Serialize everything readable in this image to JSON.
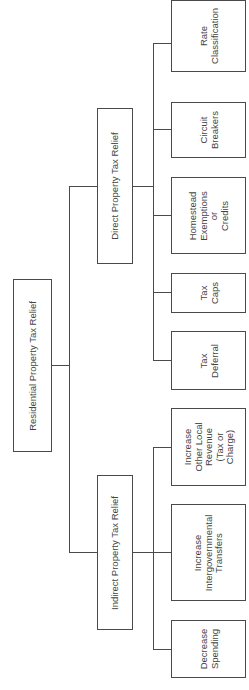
{
  "diagram": {
    "orientation": "rotated-90-ccw",
    "root": {
      "label": "Residential Property Tax Relief"
    },
    "branches": [
      {
        "label": "Direct Property Tax Relief",
        "children": [
          {
            "label": "Rate\nClassification"
          },
          {
            "label": "Circuit\nBreakers"
          },
          {
            "label": "Homestead\nExemptions\nor\nCredits"
          },
          {
            "label": "Tax\nCaps"
          },
          {
            "label": "Tax\nDeferral"
          }
        ]
      },
      {
        "label": "Indirect Property Tax Relief",
        "children": [
          {
            "label": "Increase\nOther Local\nRevenue\n(Tax or\nCharge)"
          },
          {
            "label": "Increase\nIntergovernmental\nTransfers"
          },
          {
            "label": "Decrease\nSpending"
          }
        ]
      }
    ],
    "colors": {
      "line": "#4a4a4a",
      "text": "#444444",
      "background": "#ffffff"
    }
  }
}
